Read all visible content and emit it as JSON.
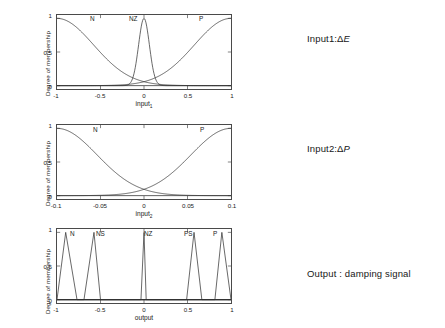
{
  "meta": {
    "figure_title": "Fuzzy membership functions for damping controller"
  },
  "side_labels": [
    {
      "name": "input1-label",
      "prefix": "Input1:",
      "delta": "Δ",
      "var": "E"
    },
    {
      "name": "input2-label",
      "prefix": "Input2:",
      "delta": "Δ",
      "var": "P"
    },
    {
      "name": "output-label",
      "prefix": "Output : damping signal",
      "delta": "",
      "var": ""
    }
  ],
  "chart_data": [
    {
      "id": "input1",
      "type": "line",
      "title": "",
      "xlabel": "input",
      "xlabel_sub": "1",
      "ylabel": "Degree of membership",
      "xlim": [
        -1,
        1
      ],
      "ylim": [
        -0.05,
        1.05
      ],
      "xticks": [
        -1,
        -0.5,
        0,
        0.5,
        1
      ],
      "xticklabels": [
        "-1",
        "-0.5",
        "0",
        "0.5",
        "1"
      ],
      "yticks": [
        0,
        0.5,
        1
      ],
      "yticklabels": [
        "0",
        "0.5",
        "1"
      ],
      "grid": false,
      "legend": "none",
      "annotations": [
        {
          "text": "N",
          "x": -0.62,
          "y": 0.92
        },
        {
          "text": "NZ",
          "x": -0.13,
          "y": 0.95
        },
        {
          "text": "P",
          "x": 0.62,
          "y": 0.92
        }
      ],
      "series": [
        {
          "name": "N",
          "shape": "gaussian-half-left",
          "center": -1.0,
          "sigma": 0.42
        },
        {
          "name": "NZ",
          "shape": "gaussian",
          "center": 0.0,
          "sigma": 0.062
        },
        {
          "name": "P",
          "shape": "gaussian-half-right",
          "center": 1.0,
          "sigma": 0.42
        }
      ]
    },
    {
      "id": "input2",
      "type": "line",
      "title": "",
      "xlabel": "input",
      "xlabel_sub": "2",
      "ylabel": "Degree of membership",
      "xlim": [
        -0.1,
        0.1
      ],
      "ylim": [
        -0.05,
        1.05
      ],
      "xticks": [
        -0.1,
        -0.05,
        0,
        0.05,
        0.1
      ],
      "xticklabels": [
        "-0.1",
        "-0.05",
        "0",
        "0.05",
        "0.1"
      ],
      "yticks": [
        0,
        0.5,
        1
      ],
      "yticklabels": [
        "0",
        "0.5",
        "1"
      ],
      "grid": false,
      "legend": "none",
      "annotations": [
        {
          "text": "N",
          "x": -0.062,
          "y": 0.93
        },
        {
          "text": "P",
          "x": 0.058,
          "y": 0.93
        }
      ],
      "series": [
        {
          "name": "N",
          "shape": "gaussian-half-left",
          "center": -0.1,
          "sigma": 0.046
        },
        {
          "name": "P",
          "shape": "gaussian-half-right",
          "center": 0.1,
          "sigma": 0.046
        }
      ]
    },
    {
      "id": "output",
      "type": "line",
      "title": "",
      "xlabel": "output",
      "xlabel_sub": "",
      "ylabel": "Degree of membership",
      "xlim": [
        -1,
        1
      ],
      "ylim": [
        -0.05,
        1.05
      ],
      "xticks": [
        -1,
        -0.5,
        0,
        0.5,
        1
      ],
      "xticklabels": [
        "-1",
        "-0.5",
        "0",
        "0.5",
        "1"
      ],
      "yticks": [
        0,
        0.5,
        1
      ],
      "yticklabels": [
        "0",
        "0.5",
        "1"
      ],
      "grid": false,
      "legend": "none",
      "annotations": [
        {
          "text": "N",
          "x": -0.84,
          "y": 0.95
        },
        {
          "text": "NS",
          "x": -0.55,
          "y": 0.95
        },
        {
          "text": "NZ",
          "x": 0.03,
          "y": 0.95
        },
        {
          "text": "PS",
          "x": 0.49,
          "y": 0.95
        },
        {
          "text": "P",
          "x": 0.84,
          "y": 0.95
        }
      ],
      "series": [
        {
          "name": "N",
          "shape": "triangle",
          "left": -1.0,
          "peak": -0.9,
          "right": -0.77
        },
        {
          "name": "NS",
          "shape": "triangle",
          "left": -0.69,
          "peak": -0.575,
          "right": -0.5
        },
        {
          "name": "NZ",
          "shape": "triangle",
          "left": -0.035,
          "peak": 0.0,
          "right": 0.025
        },
        {
          "name": "PS",
          "shape": "triangle",
          "left": 0.49,
          "peak": 0.575,
          "right": 0.665
        },
        {
          "name": "P",
          "shape": "triangle",
          "left": 0.815,
          "peak": 0.895,
          "right": 1.0
        }
      ]
    }
  ]
}
